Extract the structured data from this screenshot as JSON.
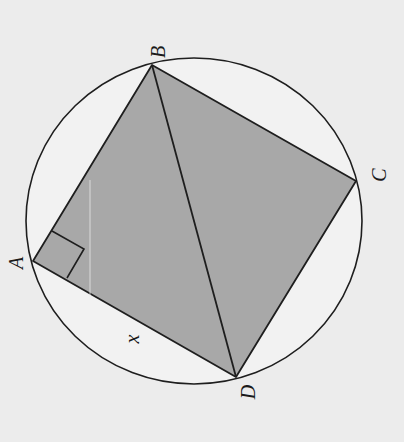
{
  "diagram": {
    "type": "cyclic quadrilateral inscribed in circle",
    "colors": {
      "background": "#ececec",
      "fill": "#a9a9a9",
      "stroke": "#1e1e1e",
      "circle_fill": "#f3f3f3"
    },
    "points": {
      "A": {
        "label": "A",
        "x": 33,
        "y": 261
      },
      "B": {
        "label": "B",
        "x": 152,
        "y": 65
      },
      "C": {
        "label": "C",
        "x": 356,
        "y": 181
      },
      "D": {
        "label": "D",
        "x": 236,
        "y": 377
      }
    },
    "circle": {
      "cx": 194,
      "cy": 221,
      "rx": 168,
      "ry": 163
    },
    "diagonal": "BD",
    "right_angle_at": "A",
    "side_label": {
      "text": "x",
      "side": "AD"
    }
  }
}
